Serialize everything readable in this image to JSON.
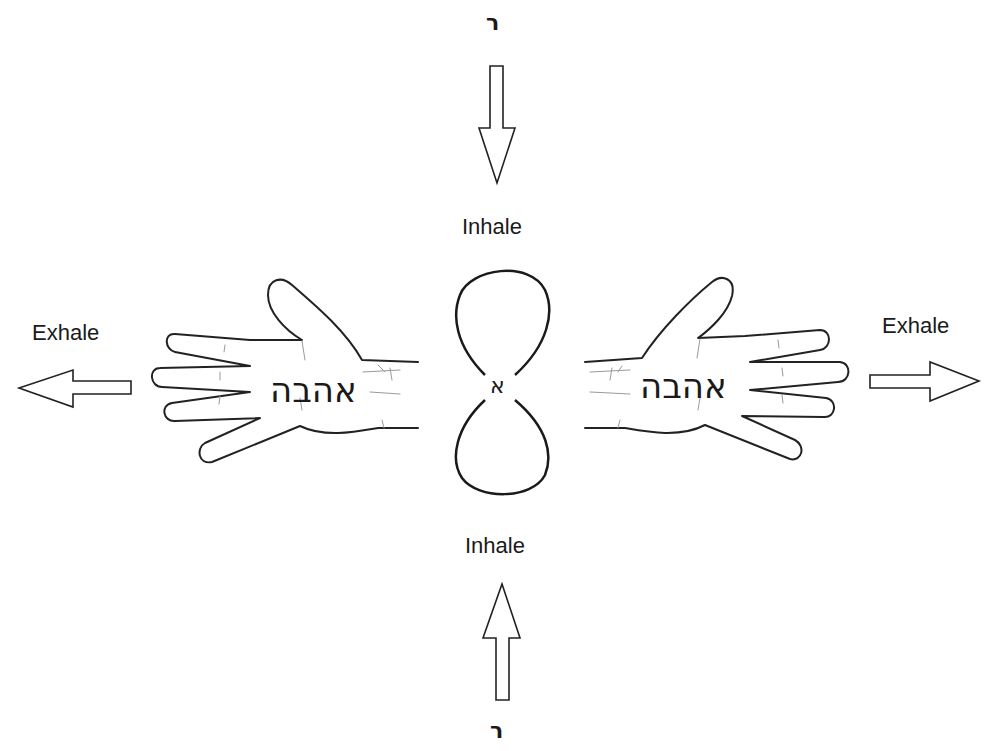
{
  "diagram": {
    "top_glyph": "ר",
    "bottom_glyph": "ר",
    "inhale_top_label": "Inhale",
    "inhale_bottom_label": "Inhale",
    "exhale_left_label": "Exhale",
    "exhale_right_label": "Exhale",
    "center_glyph": "א",
    "left_hand_word": "אהבה",
    "right_hand_word": "אהבה",
    "arrows": {
      "top": "down",
      "bottom": "up",
      "left": "left",
      "right": "right"
    },
    "center_shape": "figure-eight-loop"
  }
}
